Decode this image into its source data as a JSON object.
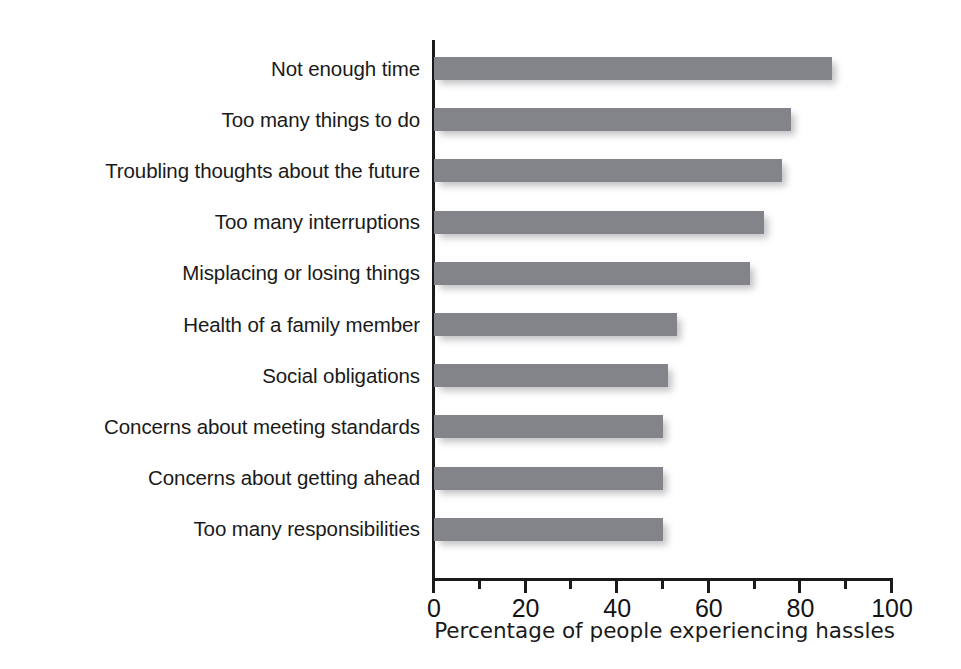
{
  "chart_data": {
    "type": "bar",
    "orientation": "horizontal",
    "title": "",
    "xlabel": "Percentage of people experiencing hassles",
    "ylabel": "",
    "xlim": [
      0,
      100
    ],
    "grid": false,
    "legend": "none",
    "xticks": [
      0,
      20,
      40,
      60,
      80,
      100
    ],
    "xtick_labels": [
      "0",
      "20",
      "40",
      "60",
      "80",
      "100"
    ],
    "minor_xticks": [
      10,
      30,
      50,
      70,
      90
    ],
    "bar_color": "#83838a",
    "axis_color": "#1a1a1a",
    "categories": [
      "Not enough time",
      "Too many things to do",
      "Troubling thoughts about the future",
      "Too many interruptions",
      "Misplacing or losing things",
      "Health of a family member",
      "Social obligations",
      "Concerns about meeting standards",
      "Concerns about getting ahead",
      "Too many responsibilities"
    ],
    "values": [
      87,
      78,
      76,
      72,
      69,
      53,
      51,
      50,
      50,
      50
    ]
  }
}
